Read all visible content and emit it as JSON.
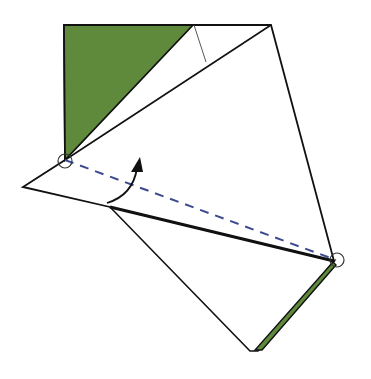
{
  "diagram": {
    "type": "origami-fold-step",
    "colors": {
      "paper_back": "#5f8a3c",
      "paper_front": "#ffffff",
      "outline": "#111111",
      "valley_fold_line": "#3d4a8f",
      "arrow": "#111111",
      "reference_circle": "#333333"
    },
    "elements": {
      "green_flap": "colored triangular flap at top-left",
      "green_strip": "thin colored edge at bottom-right",
      "valley_fold": "dashed diagonal fold line between two circled points",
      "fold_arrow": "curved arrow indicating fold up",
      "reference_points": [
        "left circled point",
        "right circled point"
      ]
    }
  }
}
